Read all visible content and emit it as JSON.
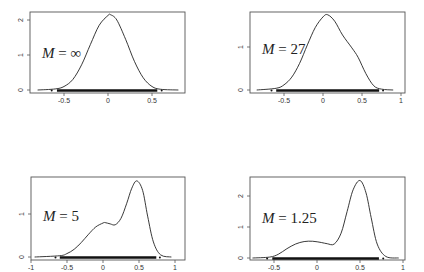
{
  "figure": {
    "width": 424,
    "height": 272,
    "layout": "2x2 grid of density plots with rug marks"
  },
  "chart_data": [
    {
      "type": "line",
      "panel": "top-left",
      "title": "",
      "annotation": {
        "symbol": "M",
        "value": "∞",
        "text": "M = ∞"
      },
      "xlabel": "",
      "ylabel": "",
      "xticks": [
        -0.5,
        0,
        0.5
      ],
      "xtick_labels": [
        "-0.5",
        "0",
        "0.5"
      ],
      "yticks": [
        0,
        1,
        2
      ],
      "ytick_labels": [
        "0",
        "1",
        "2"
      ],
      "xlim": [
        -0.85,
        0.9
      ],
      "ylim": [
        0,
        2.25
      ],
      "grid": false,
      "rug_range": [
        -0.58,
        0.56
      ],
      "series": [
        {
          "name": "density",
          "x": [
            -0.8,
            -0.6,
            -0.5,
            -0.4,
            -0.3,
            -0.2,
            -0.1,
            0,
            0.03,
            0.1,
            0.2,
            0.3,
            0.4,
            0.5,
            0.6,
            0.8
          ],
          "y": [
            0.0,
            0.03,
            0.1,
            0.3,
            0.72,
            1.3,
            1.85,
            2.13,
            2.15,
            2.0,
            1.45,
            0.82,
            0.35,
            0.1,
            0.02,
            0.0
          ]
        }
      ],
      "frame_px": {
        "left": 30,
        "top": 12,
        "right": 185,
        "bottom": 93
      },
      "axis_px": {
        "x0": 108,
        "px_per_x": 88,
        "y0": 90,
        "px_per_y": 35
      }
    },
    {
      "type": "line",
      "panel": "top-right",
      "title": "",
      "annotation": {
        "symbol": "M",
        "value": "27",
        "text": "M = 27"
      },
      "xlabel": "",
      "ylabel": "",
      "xticks": [
        -0.5,
        0,
        0.5,
        1
      ],
      "xtick_labels": [
        "-0.5",
        "0",
        "0.5",
        "1"
      ],
      "yticks": [
        0,
        1
      ],
      "ytick_labels": [
        "0",
        "1"
      ],
      "xlim": [
        -0.9,
        1.05
      ],
      "ylim": [
        0,
        1.8
      ],
      "grid": false,
      "rug_range": [
        -0.6,
        0.72
      ],
      "series": [
        {
          "name": "density",
          "x": [
            -0.85,
            -0.6,
            -0.5,
            -0.4,
            -0.3,
            -0.2,
            -0.1,
            0,
            0.06,
            0.15,
            0.25,
            0.37,
            0.45,
            0.55,
            0.65,
            0.75,
            0.9
          ],
          "y": [
            0.0,
            0.04,
            0.12,
            0.3,
            0.62,
            1.05,
            1.45,
            1.7,
            1.75,
            1.6,
            1.28,
            0.98,
            0.76,
            0.38,
            0.1,
            0.02,
            0.0
          ]
        }
      ],
      "frame_px": {
        "left": 250,
        "top": 12,
        "right": 405,
        "bottom": 93
      },
      "axis_px": {
        "x0": 323,
        "px_per_x": 78,
        "y0": 90,
        "px_per_y": 43
      }
    },
    {
      "type": "line",
      "panel": "bottom-left",
      "title": "",
      "annotation": {
        "symbol": "M",
        "value": "5",
        "text": "M = 5"
      },
      "xlabel": "",
      "ylabel": "",
      "xticks": [
        -1,
        -0.5,
        0,
        0.5,
        1
      ],
      "xtick_labels": [
        "-1",
        "-0.5",
        "0",
        "0.5",
        "1"
      ],
      "yticks": [
        0,
        1
      ],
      "ytick_labels": [
        "0",
        "1"
      ],
      "xlim": [
        -1.0,
        1.12
      ],
      "ylim": [
        0,
        1.85
      ],
      "grid": false,
      "rug_range": [
        -0.6,
        0.74
      ],
      "series": [
        {
          "name": "density",
          "x": [
            -0.95,
            -0.6,
            -0.5,
            -0.4,
            -0.3,
            -0.2,
            -0.1,
            0,
            0.03,
            0.1,
            0.17,
            0.25,
            0.33,
            0.4,
            0.47,
            0.55,
            0.62,
            0.7,
            0.8,
            0.95
          ],
          "y": [
            0.0,
            0.03,
            0.08,
            0.18,
            0.34,
            0.53,
            0.7,
            0.79,
            0.8,
            0.77,
            0.75,
            0.9,
            1.25,
            1.6,
            1.77,
            1.55,
            0.95,
            0.35,
            0.05,
            0.0
          ]
        }
      ],
      "frame_px": {
        "left": 31,
        "top": 177,
        "right": 185,
        "bottom": 260
      },
      "axis_px": {
        "x0": 103,
        "px_per_x": 72,
        "y0": 257,
        "px_per_y": 43
      }
    },
    {
      "type": "line",
      "panel": "bottom-right",
      "title": "",
      "annotation": {
        "symbol": "M",
        "value": "1.25",
        "text": "M = 1.25"
      },
      "xlabel": "",
      "ylabel": "",
      "xticks": [
        -0.5,
        0,
        0.5,
        1
      ],
      "xtick_labels": [
        "-0.5",
        "0",
        "0.5",
        "1"
      ],
      "yticks": [
        0,
        1,
        2
      ],
      "ytick_labels": [
        "0",
        "1",
        "2"
      ],
      "xlim": [
        -0.8,
        1.05
      ],
      "ylim": [
        0,
        2.6
      ],
      "grid": false,
      "rug_range": [
        -0.52,
        0.72
      ],
      "series": [
        {
          "name": "density",
          "x": [
            -0.75,
            -0.55,
            -0.45,
            -0.35,
            -0.25,
            -0.15,
            -0.05,
            0.05,
            0.12,
            0.2,
            0.28,
            0.35,
            0.42,
            0.5,
            0.57,
            0.63,
            0.7,
            0.8,
            0.95
          ],
          "y": [
            0.0,
            0.03,
            0.12,
            0.3,
            0.45,
            0.53,
            0.54,
            0.5,
            0.46,
            0.45,
            0.8,
            1.5,
            2.2,
            2.5,
            2.1,
            1.3,
            0.45,
            0.05,
            0.0
          ]
        }
      ],
      "frame_px": {
        "left": 250,
        "top": 177,
        "right": 405,
        "bottom": 260
      },
      "axis_px": {
        "x0": 317,
        "px_per_x": 86,
        "y0": 258,
        "px_per_y": 31
      }
    }
  ]
}
